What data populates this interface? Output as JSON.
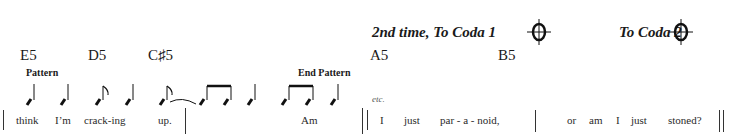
{
  "coda": {
    "first": "2nd time, To Coda 1",
    "second": "To Coda 2"
  },
  "chords": {
    "c1": "E5",
    "c2": "D5",
    "c3": "C♯5",
    "c4": "A5",
    "c5": "B5"
  },
  "markers": {
    "pattern_start": "Pattern",
    "pattern_end": "End Pattern",
    "etc": "etc."
  },
  "lyrics": {
    "w1": "think",
    "w2": "I’m",
    "w3": "crack-ing",
    "w4": "up.",
    "w5": "Am",
    "w6": "I",
    "w7": "just",
    "w8": "par - a  -  noid,",
    "w9": "or",
    "w10": "am",
    "w11": "I",
    "w12": "just",
    "w13": "stoned?"
  }
}
